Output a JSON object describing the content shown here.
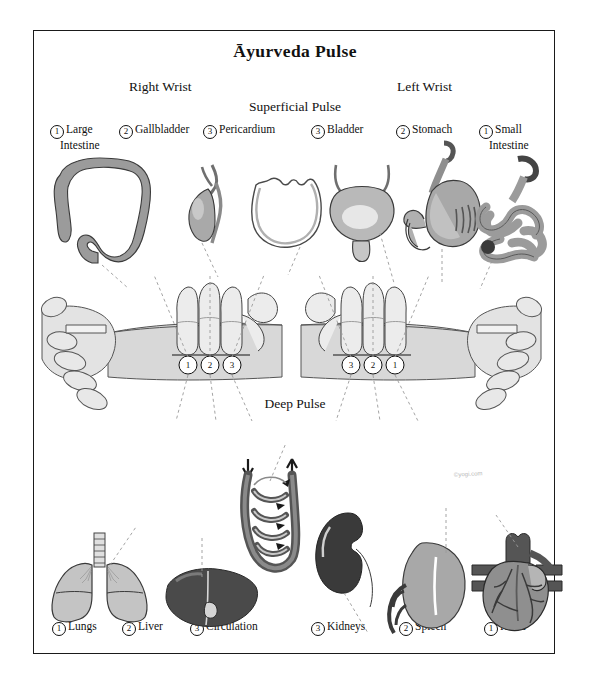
{
  "page": {
    "title": "Āyurveda Pulse",
    "signature": "©yogi.com"
  },
  "headers": {
    "right_wrist": "Right Wrist",
    "left_wrist": "Left Wrist",
    "superficial_pulse": "Superficial Pulse",
    "deep_pulse": "Deep Pulse"
  },
  "superficial": {
    "right_wrist": [
      {
        "num": "1",
        "name": "Large",
        "name2": "Intestine",
        "organ_icon": "large-intestine-illustration"
      },
      {
        "num": "2",
        "name": "Gallbladder",
        "name2": "",
        "organ_icon": "gallbladder-illustration"
      },
      {
        "num": "3",
        "name": "Pericardium",
        "name2": "",
        "organ_icon": "pericardium-illustration"
      }
    ],
    "left_wrist": [
      {
        "num": "3",
        "name": "Bladder",
        "name2": "",
        "organ_icon": "bladder-illustration"
      },
      {
        "num": "2",
        "name": "Stomach",
        "name2": "",
        "organ_icon": "stomach-illustration"
      },
      {
        "num": "1",
        "name": "Small",
        "name2": "Intestine",
        "organ_icon": "small-intestine-illustration"
      }
    ]
  },
  "deep": {
    "right_wrist": [
      {
        "num": "1",
        "name": "Lungs",
        "organ_icon": "lungs-illustration"
      },
      {
        "num": "2",
        "name": "Liver",
        "organ_icon": "liver-illustration"
      },
      {
        "num": "3",
        "name": "Circulation",
        "organ_icon": "circulation-illustration"
      }
    ],
    "left_wrist": [
      {
        "num": "3",
        "name": "Kidneys",
        "organ_icon": "kidney-illustration"
      },
      {
        "num": "2",
        "name": "Spleen",
        "organ_icon": "spleen-illustration"
      },
      {
        "num": "1",
        "name": "Heart",
        "organ_icon": "heart-illustration"
      }
    ]
  },
  "finger_positions": {
    "right_wrist": [
      "1",
      "2",
      "3"
    ],
    "left_wrist": [
      "3",
      "2",
      "1"
    ]
  },
  "colors": {
    "border": "#1a1a1a",
    "organ_mid": "#9b9b9b",
    "organ_light": "#c9c9c9",
    "organ_dark": "#4a4a4a",
    "skin": "#d8d8d8",
    "dash_line": "#9a9a9a",
    "background": "#ffffff"
  }
}
